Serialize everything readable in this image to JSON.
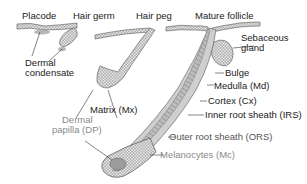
{
  "stages": [
    {
      "label": "Placode"
    },
    {
      "label": "Hair germ"
    },
    {
      "label": "Hair peg"
    },
    {
      "label": "Mature follicle"
    }
  ],
  "annotations": {
    "dermal_condensate": [
      "Dermal",
      "condensate"
    ],
    "sebaceous_gland": [
      "Sebaceous",
      "gland"
    ],
    "bulge": "Bulge",
    "medulla": "Medulla (Md)",
    "cortex": "Cortex (Cx)",
    "irs": "Inner root sheath (IRS)",
    "ors": "Outer root sheath (ORS)",
    "melanocytes": "Melanocytes (Mc)",
    "matrix": "Matrix (Mx)",
    "dermal_papilla": [
      "Dermal",
      "papilla (DP)"
    ]
  },
  "colors": {
    "text_dark": "#222222",
    "text_gray": "#555555",
    "text_light": "#8a8a8a",
    "tissue_stroke": "#555555",
    "tissue_fill": "#d9d9d9"
  }
}
